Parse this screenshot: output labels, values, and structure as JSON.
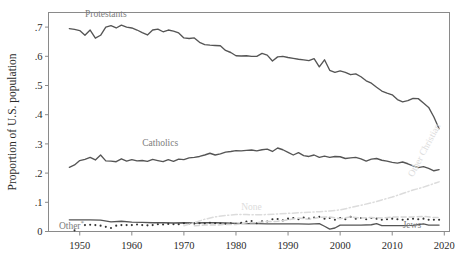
{
  "chart_data": {
    "type": "line",
    "title": "",
    "xlabel": "",
    "ylabel": "Proportion of U.S. population",
    "xlim": [
      1944,
      2021
    ],
    "ylim": [
      0,
      0.75
    ],
    "grid": false,
    "legend_position": "inline-annotations",
    "xticks": [
      1950,
      1960,
      1970,
      1980,
      1990,
      2000,
      2010,
      2020
    ],
    "xtick_labels": [
      "1950",
      "1960",
      "1970",
      "1980",
      "1990",
      "2000",
      "2010",
      "2020"
    ],
    "yticks": [
      0,
      0.1,
      0.2,
      0.3,
      0.4,
      0.5,
      0.6,
      0.7
    ],
    "ytick_labels": [
      "0",
      ".1",
      ".2",
      ".3",
      ".4",
      ".5",
      ".6",
      ".7"
    ],
    "series": [
      {
        "name": "Protestants",
        "label": "Protestants",
        "style": "solid",
        "color": "#555555",
        "label_x": 1951,
        "label_y": 0.735,
        "label_anchor": "start",
        "label_rotate": 0,
        "x": [
          1948,
          1949,
          1950,
          1951,
          1952,
          1953,
          1954,
          1955,
          1956,
          1957,
          1958,
          1959,
          1960,
          1961,
          1962,
          1963,
          1964,
          1965,
          1966,
          1967,
          1968,
          1969,
          1970,
          1971,
          1972,
          1973,
          1974,
          1975,
          1976,
          1977,
          1978,
          1979,
          1980,
          1981,
          1982,
          1983,
          1984,
          1985,
          1986,
          1987,
          1988,
          1989,
          1990,
          1991,
          1992,
          1993,
          1994,
          1995,
          1996,
          1997,
          1998,
          1999,
          2000,
          2001,
          2002,
          2003,
          2004,
          2005,
          2006,
          2007,
          2008,
          2009,
          2010,
          2011,
          2012,
          2013,
          2014,
          2015,
          2016,
          2017,
          2018,
          2019
        ],
        "y": [
          0.695,
          0.692,
          0.688,
          0.672,
          0.69,
          0.662,
          0.672,
          0.7,
          0.705,
          0.697,
          0.707,
          0.7,
          0.697,
          0.69,
          0.681,
          0.673,
          0.69,
          0.693,
          0.684,
          0.69,
          0.686,
          0.68,
          0.663,
          0.661,
          0.663,
          0.648,
          0.64,
          0.638,
          0.637,
          0.636,
          0.62,
          0.613,
          0.602,
          0.601,
          0.602,
          0.6,
          0.6,
          0.61,
          0.604,
          0.584,
          0.598,
          0.6,
          0.596,
          0.593,
          0.59,
          0.588,
          0.585,
          0.592,
          0.564,
          0.588,
          0.552,
          0.545,
          0.55,
          0.545,
          0.537,
          0.54,
          0.53,
          0.516,
          0.508,
          0.494,
          0.481,
          0.474,
          0.468,
          0.452,
          0.444,
          0.448,
          0.456,
          0.455,
          0.44,
          0.425,
          0.392,
          0.352
        ]
      },
      {
        "name": "Catholics",
        "label": "Catholics",
        "style": "solid",
        "color": "#555555",
        "label_x": 1962,
        "label_y": 0.293,
        "label_anchor": "start",
        "label_rotate": 0,
        "x": [
          1948,
          1949,
          1950,
          1951,
          1952,
          1953,
          1954,
          1955,
          1956,
          1957,
          1958,
          1959,
          1960,
          1961,
          1962,
          1963,
          1964,
          1965,
          1966,
          1967,
          1968,
          1969,
          1970,
          1971,
          1972,
          1973,
          1974,
          1975,
          1976,
          1977,
          1978,
          1979,
          1980,
          1981,
          1982,
          1983,
          1984,
          1985,
          1986,
          1987,
          1988,
          1989,
          1990,
          1991,
          1992,
          1993,
          1994,
          1995,
          1996,
          1997,
          1998,
          1999,
          2000,
          2001,
          2002,
          2003,
          2004,
          2005,
          2006,
          2007,
          2008,
          2009,
          2010,
          2011,
          2012,
          2013,
          2014,
          2015,
          2016,
          2017,
          2018,
          2019
        ],
        "y": [
          0.22,
          0.228,
          0.243,
          0.247,
          0.254,
          0.245,
          0.262,
          0.242,
          0.241,
          0.239,
          0.249,
          0.241,
          0.246,
          0.242,
          0.243,
          0.24,
          0.247,
          0.243,
          0.239,
          0.246,
          0.24,
          0.248,
          0.246,
          0.252,
          0.254,
          0.257,
          0.262,
          0.268,
          0.262,
          0.266,
          0.272,
          0.274,
          0.277,
          0.276,
          0.278,
          0.279,
          0.276,
          0.28,
          0.282,
          0.274,
          0.286,
          0.28,
          0.271,
          0.262,
          0.27,
          0.26,
          0.257,
          0.262,
          0.254,
          0.258,
          0.254,
          0.257,
          0.256,
          0.25,
          0.252,
          0.254,
          0.249,
          0.241,
          0.248,
          0.25,
          0.244,
          0.241,
          0.237,
          0.234,
          0.238,
          0.232,
          0.225,
          0.219,
          0.222,
          0.216,
          0.208,
          0.212
        ]
      },
      {
        "name": "Jews",
        "label": "Jews",
        "style": "solid",
        "color": "#555555",
        "label_x": 2012,
        "label_y": 0.012,
        "label_anchor": "start",
        "label_rotate": 0,
        "x": [
          1948,
          1950,
          1952,
          1954,
          1956,
          1958,
          1960,
          1962,
          1964,
          1966,
          1968,
          1970,
          1972,
          1974,
          1976,
          1978,
          1980,
          1982,
          1984,
          1986,
          1988,
          1990,
          1992,
          1994,
          1996,
          1997,
          1998,
          1999,
          2000,
          2002,
          2004,
          2006,
          2007,
          2008,
          2010,
          2012,
          2014,
          2016,
          2017,
          2018,
          2019
        ],
        "y": [
          0.04,
          0.04,
          0.04,
          0.039,
          0.033,
          0.035,
          0.032,
          0.031,
          0.03,
          0.03,
          0.029,
          0.03,
          0.029,
          0.03,
          0.03,
          0.029,
          0.028,
          0.027,
          0.027,
          0.026,
          0.026,
          0.026,
          0.026,
          0.025,
          0.027,
          0.018,
          0.008,
          0.012,
          0.022,
          0.022,
          0.022,
          0.023,
          0.027,
          0.02,
          0.02,
          0.02,
          0.021,
          0.026,
          0.022,
          0.022,
          0.022
        ]
      },
      {
        "name": "Other",
        "label": "Other*",
        "style": "dotted",
        "color": "#333333",
        "label_x": 1946,
        "label_y": 0.008,
        "label_anchor": "start",
        "label_rotate": 0,
        "x": [
          1949,
          1951,
          1952,
          1953,
          1954,
          1955,
          1956,
          1957,
          1958,
          1959,
          1960,
          1961,
          1962,
          1963,
          1964,
          1965,
          1966,
          1967,
          1968,
          1969,
          1970,
          1971,
          1972,
          1973,
          1974,
          1975,
          1976,
          1977,
          1978,
          1979,
          1980,
          1981,
          1982,
          1983,
          1984,
          1985,
          1986,
          1987,
          1988,
          1989,
          1990,
          1991,
          1992,
          1993,
          1994,
          1995,
          1996,
          1997,
          1998,
          1999,
          2000,
          2001,
          2002,
          2003,
          2004,
          2005,
          2006,
          2007,
          2008,
          2009,
          2010,
          2011,
          2012,
          2013,
          2014,
          2015,
          2016,
          2017,
          2018,
          2019
        ],
        "y": [
          0.004,
          0.022,
          0.023,
          0.022,
          0.02,
          0.016,
          0.012,
          0.02,
          0.022,
          0.022,
          0.022,
          0.024,
          0.022,
          0.021,
          0.022,
          0.025,
          0.024,
          0.026,
          0.025,
          0.025,
          0.028,
          0.026,
          0.027,
          0.028,
          0.027,
          0.03,
          0.028,
          0.027,
          0.026,
          0.028,
          0.026,
          0.03,
          0.034,
          0.036,
          0.028,
          0.035,
          0.034,
          0.042,
          0.043,
          0.038,
          0.044,
          0.046,
          0.042,
          0.048,
          0.044,
          0.048,
          0.05,
          0.044,
          0.046,
          0.04,
          0.046,
          0.042,
          0.05,
          0.044,
          0.046,
          0.042,
          0.046,
          0.044,
          0.04,
          0.042,
          0.044,
          0.042,
          0.04,
          0.042,
          0.044,
          0.042,
          0.044,
          0.04,
          0.04,
          0.04
        ]
      },
      {
        "name": "None",
        "label": "None",
        "style": "dashed",
        "color": "#d5d5d5",
        "label_x": 1981,
        "label_y": 0.072,
        "label_anchor": "start",
        "label_rotate": 0,
        "x": [
          1972,
          1974,
          1976,
          1978,
          1980,
          1982,
          1984,
          1986,
          1988,
          1990,
          1992,
          1994,
          1996,
          1998,
          2000,
          2002,
          2004,
          2006,
          2008,
          2010,
          2012,
          2014,
          2016,
          2018,
          2019
        ],
        "y": [
          0.02,
          0.022,
          0.022,
          0.024,
          0.024,
          0.03,
          0.03,
          0.034,
          0.035,
          0.04,
          0.046,
          0.042,
          0.048,
          0.05,
          0.044,
          0.05,
          0.046,
          0.048,
          0.046,
          0.05,
          0.05,
          0.05,
          0.052,
          0.048,
          0.048
        ]
      },
      {
        "name": "Other Christian",
        "label": "Other Christian",
        "style": "dashdot",
        "color": "#dcdcdc",
        "label_x": 2014,
        "label_y": 0.185,
        "label_anchor": "start",
        "label_rotate": -62,
        "x": [
          1970,
          1972,
          1974,
          1976,
          1978,
          1980,
          1982,
          1984,
          1986,
          1988,
          1990,
          1992,
          1994,
          1996,
          1998,
          2000,
          2002,
          2004,
          2006,
          2008,
          2010,
          2012,
          2014,
          2016,
          2018,
          2019
        ],
        "y": [
          0.02,
          0.03,
          0.042,
          0.05,
          0.055,
          0.058,
          0.058,
          0.057,
          0.058,
          0.06,
          0.062,
          0.064,
          0.066,
          0.068,
          0.07,
          0.074,
          0.082,
          0.09,
          0.098,
          0.108,
          0.118,
          0.13,
          0.142,
          0.152,
          0.164,
          0.17
        ]
      }
    ]
  },
  "axes": {
    "ylabel": "Proportion of U.S. population"
  }
}
